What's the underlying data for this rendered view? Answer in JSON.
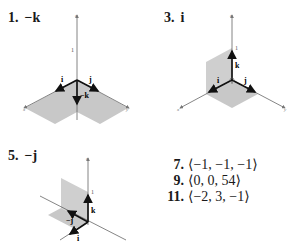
{
  "exercises": [
    {
      "number": "1.",
      "answer": "−k",
      "figure": {
        "labels": {
          "i": "i",
          "j": "j",
          "vector": "−k",
          "tick": "1",
          "x": "x",
          "y": "y",
          "z": "z"
        }
      }
    },
    {
      "number": "3.",
      "answer": "i",
      "figure": {
        "labels": {
          "i": "i",
          "j": "j",
          "k": "k",
          "tick": "1",
          "x": "x",
          "y": "y",
          "z": "z"
        }
      }
    },
    {
      "number": "5.",
      "answer": "−j",
      "figure": {
        "labels": {
          "i": "i",
          "vector": "−j",
          "k": "k",
          "tick": "1",
          "x": "x",
          "y": "y",
          "z": "z"
        }
      }
    }
  ],
  "answers": [
    {
      "number": "7.",
      "value": "⟨−1, −1, −1⟩"
    },
    {
      "number": "9.",
      "value": "⟨0, 0, 54⟩"
    },
    {
      "number": "11.",
      "value": "⟨−2, 3, −1⟩"
    }
  ],
  "colors": {
    "plane": "#c8c8c8",
    "axis": "#555555",
    "vector": "#111111"
  }
}
